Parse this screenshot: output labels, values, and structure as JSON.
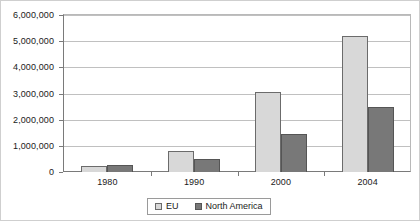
{
  "chart_data": {
    "type": "bar",
    "title": "",
    "subtitle": "",
    "xlabel": "",
    "ylabel": "",
    "categories": [
      "1980",
      "1990",
      "2000",
      "2004"
    ],
    "series": [
      {
        "name": "EU",
        "color": "#d8d8d8",
        "values": [
          230000,
          800000,
          3050000,
          5200000
        ]
      },
      {
        "name": "North America",
        "color": "#787878",
        "values": [
          250000,
          500000,
          1450000,
          2500000
        ]
      }
    ],
    "ylim": [
      0,
      6000000
    ],
    "ytick_values": [
      0,
      1000000,
      2000000,
      3000000,
      4000000,
      5000000,
      6000000
    ],
    "ytick_labels": [
      "0",
      "1,000,000",
      "2,000,000",
      "3,000,000",
      "4,000,000",
      "5,000,000",
      "6,000,000"
    ],
    "grid": true,
    "grid_axis": "y",
    "legend_position": "bottom",
    "legend_entries": [
      "EU",
      "North America"
    ]
  }
}
